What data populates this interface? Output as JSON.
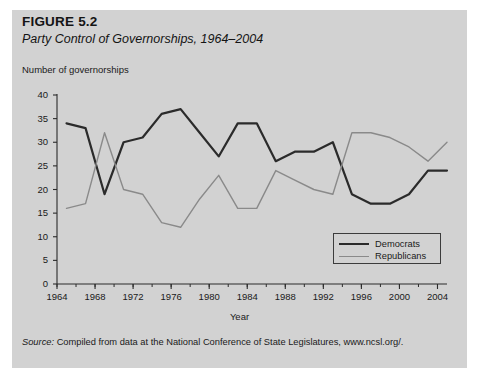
{
  "figure": {
    "number": "FIGURE 5.2",
    "title": "Party Control of Governorships, 1964–2004",
    "source": "Compiled from data at the National Conference of State Legislatures, www.ncsl.org/.",
    "source_label": "Source:",
    "background_color": "#d2d2d2",
    "page_color": "#ffffff"
  },
  "chart_data": {
    "type": "line",
    "title": "Party Control of Governorships, 1964–2004",
    "xlabel": "Year",
    "ylabel": "Number of governorships",
    "xlim": [
      1964,
      2005
    ],
    "ylim": [
      0,
      40
    ],
    "yticks": [
      0,
      5,
      10,
      15,
      20,
      25,
      30,
      35,
      40
    ],
    "xticks": [
      1964,
      1968,
      1972,
      1976,
      1980,
      1984,
      1988,
      1992,
      1996,
      2000,
      2004
    ],
    "x_minor_tick_interval": 2,
    "grid": false,
    "legend_position": "lower right",
    "series": [
      {
        "name": "Democrats",
        "color": "#2b2b2b",
        "line_width": 2.2,
        "x": [
          1965,
          1967,
          1969,
          1971,
          1973,
          1975,
          1977,
          1979,
          1981,
          1983,
          1985,
          1987,
          1989,
          1991,
          1993,
          1995,
          1997,
          1999,
          2001,
          2003,
          2005
        ],
        "values": [
          34,
          33,
          19,
          30,
          31,
          36,
          37,
          32,
          27,
          34,
          34,
          26,
          28,
          28,
          30,
          19,
          17,
          17,
          19,
          24,
          24
        ]
      },
      {
        "name": "Republicans",
        "color": "#8a8a8a",
        "line_width": 1.4,
        "x": [
          1965,
          1967,
          1969,
          1971,
          1973,
          1975,
          1977,
          1979,
          1981,
          1983,
          1985,
          1987,
          1989,
          1991,
          1993,
          1995,
          1997,
          1999,
          2001,
          2003,
          2005
        ],
        "values": [
          16,
          17,
          32,
          20,
          19,
          13,
          12,
          18,
          23,
          16,
          16,
          24,
          22,
          20,
          19,
          32,
          32,
          31,
          29,
          26,
          30
        ]
      }
    ]
  },
  "legend": {
    "items": [
      {
        "label": "Democrats"
      },
      {
        "label": "Republicans"
      }
    ]
  }
}
